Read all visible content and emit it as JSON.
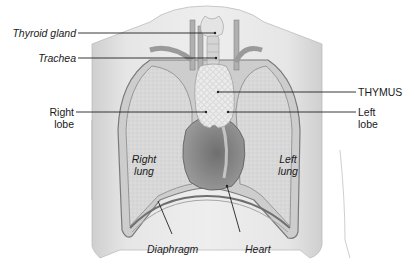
{
  "diagram": {
    "labels": {
      "thyroid_gland": "Thyroid gland",
      "trachea": "Trachea",
      "right_lobe_1": "Right",
      "right_lobe_2": "lobe",
      "thymus": "THYMUS",
      "left_lobe_1": "Left",
      "left_lobe_2": "lobe",
      "right_lung_1": "Right",
      "right_lung_2": "lung",
      "left_lung_1": "Left",
      "left_lung_2": "lung",
      "diaphragm": "Diaphragm",
      "heart": "Heart"
    },
    "colors": {
      "skin": "#e2e2e2",
      "lung": "#d6d6d6",
      "thymus": "#e8e8e8",
      "heart": "#8a8a8a",
      "vessel": "#a8a8a8",
      "leader_line": "#222222",
      "text": "#1a1a1a"
    }
  }
}
